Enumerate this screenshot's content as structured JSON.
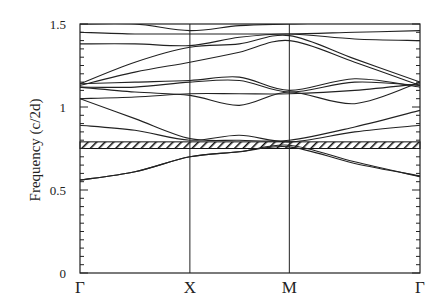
{
  "chart_data": {
    "type": "line",
    "title": "",
    "xlabel": "",
    "ylabel": "Frequency (c/2d)",
    "ylim": [
      0,
      1.5
    ],
    "yticks": [
      0,
      0.5,
      1,
      1.5
    ],
    "ytick_labels": [
      "0",
      "0.5",
      "1",
      "1.5"
    ],
    "x_high_symmetry_points": [
      {
        "label": "Γ",
        "pos": 0.0
      },
      {
        "label": "X",
        "pos": 1.0
      },
      {
        "label": "M",
        "pos": 1.905
      },
      {
        "label": "Γ",
        "pos": 3.094
      }
    ],
    "band_gap": {
      "lower": 0.75,
      "upper": 0.79,
      "style": "hatched"
    },
    "grid": false,
    "legend": null,
    "series": [
      {
        "name": "band 1",
        "x": [
          0,
          0.5,
          1.0,
          1.45,
          1.905,
          2.5,
          3.094
        ],
        "values": [
          0.56,
          0.61,
          0.7,
          0.73,
          0.77,
          0.67,
          0.58
        ]
      },
      {
        "name": "band 2",
        "x": [
          0,
          0.5,
          1.0,
          1.45,
          1.905,
          2.5,
          3.094
        ],
        "values": [
          0.56,
          0.61,
          0.7,
          0.73,
          0.76,
          0.66,
          0.585
        ]
      },
      {
        "name": "band 3",
        "x": [
          0,
          0.5,
          1.0,
          1.45,
          1.905,
          2.5,
          3.094
        ],
        "values": [
          0.89,
          0.86,
          0.8,
          0.83,
          0.79,
          0.85,
          0.89
        ]
      },
      {
        "name": "band 4",
        "x": [
          0,
          0.5,
          1.0,
          1.45,
          1.905,
          2.5,
          3.094
        ],
        "values": [
          1.05,
          0.93,
          0.81,
          0.8,
          0.8,
          0.88,
          0.98
        ]
      },
      {
        "name": "band 5",
        "x": [
          0,
          0.5,
          1.0,
          1.45,
          1.905,
          2.5,
          3.094
        ],
        "values": [
          1.05,
          1.06,
          1.08,
          1.08,
          1.08,
          1.1,
          1.14
        ]
      },
      {
        "name": "band 6",
        "x": [
          0,
          0.5,
          1.0,
          1.45,
          1.905,
          2.5,
          3.094
        ],
        "values": [
          1.12,
          1.09,
          1.07,
          1.01,
          1.09,
          1.02,
          1.15
        ]
      },
      {
        "name": "band 7",
        "x": [
          0,
          0.5,
          1.0,
          1.45,
          1.905,
          2.5,
          3.094
        ],
        "values": [
          1.12,
          1.12,
          1.15,
          1.16,
          1.09,
          1.15,
          1.13
        ]
      },
      {
        "name": "band 8",
        "x": [
          0,
          0.5,
          1.0,
          1.45,
          1.905,
          2.5,
          3.094
        ],
        "values": [
          1.14,
          1.15,
          1.16,
          1.18,
          1.1,
          1.17,
          1.12
        ]
      },
      {
        "name": "band 9",
        "x": [
          0,
          0.5,
          1.0,
          1.45,
          1.905,
          2.5,
          3.094
        ],
        "values": [
          1.13,
          1.21,
          1.27,
          1.33,
          1.4,
          1.27,
          1.13
        ]
      },
      {
        "name": "band 10",
        "x": [
          0,
          0.5,
          1.0,
          1.45,
          1.905,
          2.5,
          3.094
        ],
        "values": [
          1.14,
          1.27,
          1.36,
          1.38,
          1.43,
          1.29,
          1.15
        ]
      },
      {
        "name": "band 11",
        "x": [
          0,
          0.5,
          1.0,
          1.45,
          1.905,
          2.5,
          3.094
        ],
        "values": [
          1.38,
          1.38,
          1.37,
          1.42,
          1.44,
          1.41,
          1.4
        ]
      },
      {
        "name": "band 12",
        "x": [
          0,
          0.5,
          1.0,
          1.45,
          1.905,
          2.5,
          3.094
        ],
        "values": [
          1.45,
          1.44,
          1.44,
          1.44,
          1.44,
          1.45,
          1.46
        ]
      },
      {
        "name": "band 13",
        "x": [
          0,
          0.5,
          1.0,
          1.45,
          1.905,
          2.5,
          3.094
        ],
        "values": [
          1.5,
          1.5,
          1.46,
          1.49,
          1.5,
          1.51,
          1.51
        ]
      }
    ]
  }
}
